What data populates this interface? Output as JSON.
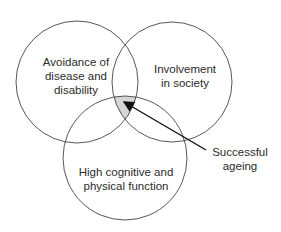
{
  "diagram": {
    "type": "venn",
    "circles": [
      {
        "id": "left",
        "label_lines": [
          "Avoidance of",
          "disease and",
          "disability"
        ]
      },
      {
        "id": "right",
        "label_lines": [
          "Involvement",
          "in society"
        ]
      },
      {
        "id": "bottom",
        "label_lines": [
          "High cognitive and",
          "physical function"
        ]
      }
    ],
    "intersection_label": {
      "lines": [
        "Successful",
        "ageing"
      ]
    },
    "colors": {
      "stroke": "#444444",
      "intersection_fill": "#d6d6d6",
      "text": "#2b2b2b"
    }
  }
}
